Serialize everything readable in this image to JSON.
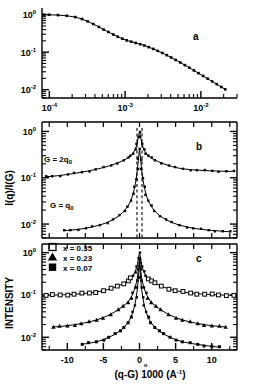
{
  "figure": {
    "panels": [
      "a",
      "b",
      "c"
    ],
    "label_a": "a",
    "label_b": "b",
    "label_c": "c"
  },
  "axes": {
    "y_label_b": "I(q)/I(G)",
    "y_label_c": "INTENSITY",
    "x_label_c_main": "(q-G) 1000 (",
    "x_label_c_unit": "A",
    "x_label_c_sup": "-1",
    "x_label_c_close": ")",
    "y_ticks_mantissa": "10",
    "y_tick_exp_0": "0",
    "y_tick_exp_m1": "-1",
    "y_tick_exp_m2": "-2",
    "x_ticks_a": [
      "10",
      "10",
      "10"
    ],
    "x_tick_exps_a": [
      "-4",
      "-3",
      "-2"
    ],
    "x_ticks_c": [
      "-10",
      "-5",
      "0",
      "5",
      "10"
    ]
  },
  "annotations": {
    "curve_label_top": "G = 2q",
    "curve_label_top_sub": "0",
    "curve_label_bottom": "G = q",
    "curve_label_bottom_sub": "0"
  },
  "legend": {
    "items": [
      {
        "marker": "open-square",
        "label": "x = 0.35"
      },
      {
        "marker": "filled-triangle",
        "label": "x = 0.23"
      },
      {
        "marker": "filled-square",
        "label": "x = 0.07"
      }
    ]
  },
  "colors": {
    "ink": "#000000",
    "background": "#ffffff"
  },
  "chart_data": [
    {
      "type": "line",
      "panel": "a",
      "title": "",
      "xlabel": "",
      "ylabel": "",
      "xscale": "log",
      "yscale": "log",
      "xlim": [
        8e-05,
        0.03
      ],
      "ylim": [
        0.006,
        1.5
      ],
      "xticks": [
        0.0001,
        0.001,
        0.01
      ],
      "yticks": [
        1,
        0.1,
        0.01
      ],
      "grid": false,
      "legend": "none",
      "series": [
        {
          "name": "scattering profile",
          "marker": "filled-square-small",
          "x": [
            8.5e-05,
            0.0001,
            0.00013,
            0.00017,
            0.00022,
            0.00027,
            0.00032,
            0.00038,
            0.00045,
            0.00052,
            0.0006,
            0.0007,
            0.0008,
            0.00092,
            0.00105,
            0.0012,
            0.00138,
            0.00158,
            0.0018,
            0.00205,
            0.00235,
            0.0027,
            0.0031,
            0.00355,
            0.00405,
            0.00465,
            0.00535,
            0.00615,
            0.00705,
            0.0081,
            0.0093,
            0.0107,
            0.0123,
            0.0141,
            0.0162,
            0.0186,
            0.021
          ],
          "y": [
            1.0,
            0.99,
            0.97,
            0.93,
            0.86,
            0.76,
            0.66,
            0.56,
            0.47,
            0.4,
            0.345,
            0.295,
            0.258,
            0.228,
            0.206,
            0.19,
            0.176,
            0.163,
            0.15,
            0.136,
            0.122,
            0.108,
            0.095,
            0.083,
            0.072,
            0.062,
            0.053,
            0.045,
            0.0385,
            0.0325,
            0.0275,
            0.0232,
            0.0196,
            0.0166,
            0.014,
            0.0118,
            0.0102
          ]
        }
      ]
    },
    {
      "type": "line",
      "panel": "b",
      "title": "",
      "xlabel": "",
      "ylabel": "I(q)/I(G)",
      "xscale": "linear",
      "yscale": "log",
      "xlim": [
        -13.5,
        13.5
      ],
      "ylim": [
        0.005,
        1.6
      ],
      "yticks": [
        1,
        0.1,
        0.01
      ],
      "grid": false,
      "vertical_dashed_lines": [
        -0.35,
        0.35
      ],
      "series": [
        {
          "name": "G = 2q0",
          "peak": 1.0,
          "baseline": 0.14,
          "x": [
            -13.0,
            -12.0,
            -11.0,
            -10.0,
            -9.0,
            -8.0,
            -7.0,
            -6.0,
            -5.0,
            -4.0,
            -3.0,
            -2.2,
            -1.6,
            -1.2,
            -0.9,
            -0.6,
            -0.35,
            -0.15,
            0.0,
            0.15,
            0.35,
            0.6,
            0.9,
            1.2,
            1.6,
            2.2,
            3.0,
            4.0,
            5.0,
            6.0,
            7.0,
            8.0,
            9.0,
            10.0,
            11.0,
            12.0,
            13.0
          ],
          "y": [
            0.105,
            0.108,
            0.112,
            0.118,
            0.124,
            0.132,
            0.141,
            0.152,
            0.166,
            0.184,
            0.21,
            0.238,
            0.268,
            0.3,
            0.34,
            0.41,
            0.53,
            0.76,
            1.0,
            0.76,
            0.53,
            0.41,
            0.34,
            0.3,
            0.268,
            0.238,
            0.21,
            0.184,
            0.166,
            0.156,
            0.15,
            0.146,
            0.143,
            0.141,
            0.139,
            0.138,
            0.137
          ]
        },
        {
          "name": "G = q0",
          "peak": 0.42,
          "baseline": 0.0075,
          "x": [
            -10.5,
            -9.5,
            -8.5,
            -7.5,
            -6.5,
            -5.5,
            -4.5,
            -3.6,
            -2.8,
            -2.1,
            -1.6,
            -1.2,
            -0.9,
            -0.65,
            -0.45,
            -0.28,
            -0.15,
            0.0,
            0.15,
            0.28,
            0.45,
            0.65,
            0.9,
            1.2,
            1.6,
            2.1,
            2.8,
            3.6,
            4.5,
            5.5,
            6.5,
            7.5,
            8.5,
            9.5,
            10.5,
            11.5,
            12.5
          ],
          "y": [
            0.0072,
            0.0074,
            0.0077,
            0.0081,
            0.0087,
            0.0095,
            0.0108,
            0.0126,
            0.0152,
            0.0192,
            0.0245,
            0.032,
            0.044,
            0.064,
            0.096,
            0.155,
            0.25,
            0.42,
            0.25,
            0.155,
            0.096,
            0.064,
            0.044,
            0.032,
            0.0245,
            0.0192,
            0.0152,
            0.0126,
            0.0108,
            0.0095,
            0.0087,
            0.0081,
            0.0077,
            0.0074,
            0.0072,
            0.007,
            0.0068
          ]
        }
      ]
    },
    {
      "type": "line",
      "panel": "c",
      "title": "",
      "xlabel": "(q-G) 1000 (A^-1)",
      "ylabel": "INTENSITY",
      "xscale": "linear",
      "yscale": "log",
      "xlim": [
        -13.5,
        13.5
      ],
      "ylim": [
        0.005,
        1.6
      ],
      "xticks": [
        -10,
        -5,
        0,
        5,
        10
      ],
      "yticks": [
        1,
        0.1,
        0.01
      ],
      "grid": false,
      "series": [
        {
          "name": "x = 0.35",
          "marker": "open-square",
          "peak": 1.0,
          "baseline": 0.1,
          "x": [
            -13.0,
            -12.0,
            -11.0,
            -10.0,
            -9.0,
            -8.0,
            -7.0,
            -6.0,
            -5.0,
            -4.0,
            -3.0,
            -2.2,
            -1.6,
            -1.2,
            -0.9,
            -0.6,
            -0.35,
            -0.15,
            0.0,
            0.15,
            0.35,
            0.6,
            0.9,
            1.2,
            1.6,
            2.2,
            3.0,
            4.0,
            5.0,
            6.0,
            7.0,
            8.0,
            9.0,
            10.0,
            11.0,
            12.0,
            13.0
          ],
          "y": [
            0.098,
            0.099,
            0.1,
            0.102,
            0.104,
            0.107,
            0.111,
            0.117,
            0.126,
            0.14,
            0.162,
            0.188,
            0.215,
            0.245,
            0.285,
            0.35,
            0.47,
            0.72,
            1.0,
            0.72,
            0.47,
            0.35,
            0.285,
            0.245,
            0.215,
            0.188,
            0.162,
            0.14,
            0.126,
            0.117,
            0.111,
            0.107,
            0.104,
            0.102,
            0.1,
            0.099,
            0.098
          ]
        },
        {
          "name": "x = 0.23",
          "marker": "filled-triangle",
          "peak": 0.72,
          "baseline": 0.018,
          "x": [
            -12.0,
            -11.0,
            -10.0,
            -9.0,
            -8.0,
            -7.0,
            -6.0,
            -5.0,
            -4.0,
            -3.0,
            -2.2,
            -1.6,
            -1.2,
            -0.9,
            -0.6,
            -0.35,
            -0.15,
            0.0,
            0.15,
            0.35,
            0.6,
            0.9,
            1.2,
            1.6,
            2.2,
            3.0,
            4.0,
            5.0,
            6.0,
            7.0,
            8.0,
            9.0,
            10.0,
            11.0,
            12.0
          ],
          "y": [
            0.0175,
            0.018,
            0.0188,
            0.0198,
            0.0212,
            0.023,
            0.0255,
            0.0292,
            0.0348,
            0.044,
            0.055,
            0.068,
            0.085,
            0.109,
            0.15,
            0.225,
            0.4,
            0.72,
            0.4,
            0.225,
            0.15,
            0.109,
            0.085,
            0.068,
            0.055,
            0.044,
            0.0348,
            0.0292,
            0.0255,
            0.023,
            0.0212,
            0.0198,
            0.0188,
            0.018,
            0.0175
          ]
        },
        {
          "name": "x = 0.07",
          "marker": "filled-square",
          "peak": 0.6,
          "baseline": 0.0068,
          "x": [
            -8.0,
            -7.0,
            -6.0,
            -5.0,
            -4.2,
            -3.4,
            -2.7,
            -2.1,
            -1.6,
            -1.2,
            -0.9,
            -0.65,
            -0.45,
            -0.28,
            -0.15,
            0.0,
            0.15,
            0.28,
            0.45,
            0.65,
            0.9,
            1.2,
            1.6,
            2.1,
            2.7,
            3.4,
            4.2,
            5.0,
            6.0,
            7.0,
            8.0,
            9.0,
            10.0,
            11.0
          ],
          "y": [
            0.0068,
            0.0072,
            0.0078,
            0.0088,
            0.01,
            0.0118,
            0.0142,
            0.0175,
            0.022,
            0.029,
            0.04,
            0.058,
            0.088,
            0.145,
            0.26,
            0.6,
            0.26,
            0.145,
            0.088,
            0.058,
            0.04,
            0.029,
            0.022,
            0.0175,
            0.0142,
            0.0118,
            0.01,
            0.0088,
            0.0078,
            0.0072,
            0.0068,
            0.0064,
            0.0061,
            0.0058
          ]
        }
      ]
    }
  ]
}
